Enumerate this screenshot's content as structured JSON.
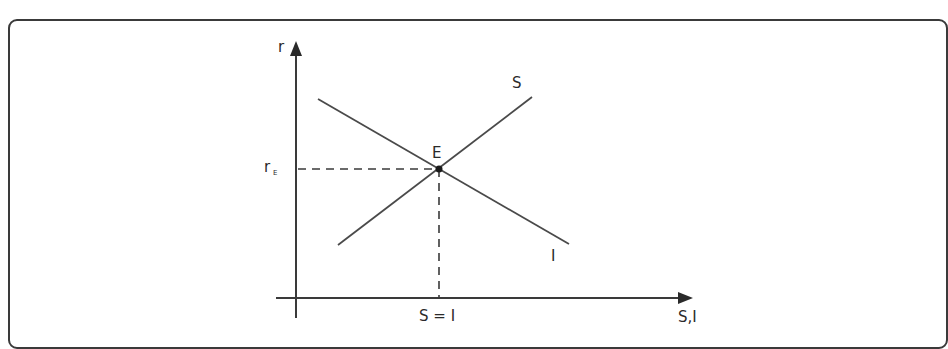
{
  "diagram": {
    "type": "supply-demand-style economic diagram (loanable funds: saving and investment)",
    "axes": {
      "y_label": "r",
      "x_label": "S,I"
    },
    "curves": [
      {
        "name": "S",
        "label": "S",
        "direction": "upward-sloping"
      },
      {
        "name": "I",
        "label": "I",
        "direction": "downward-sloping"
      }
    ],
    "equilibrium": {
      "point_label": "E",
      "rate_label_main": "r",
      "rate_label_sub": "E",
      "quantity_label": "S = I"
    }
  },
  "colors": {
    "line": "#4a4a4a",
    "axis": "#3a3a3a",
    "frame": "#3a3a3a",
    "text": "#2a2a2a",
    "point": "#1a1a1a"
  }
}
